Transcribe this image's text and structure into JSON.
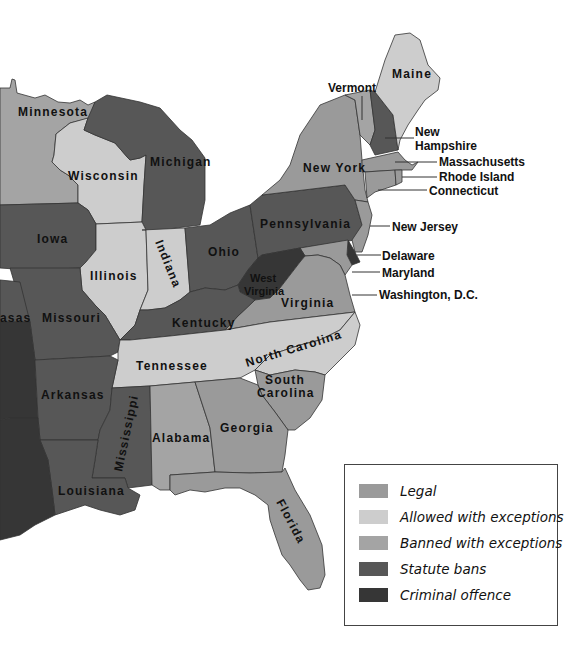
{
  "colors": {
    "legal": "#9a9a9a",
    "allowed": "#cdcdcd",
    "banned_exceptions": "#a4a4a4",
    "statute": "#575757",
    "criminal": "#363636"
  },
  "legend": {
    "items": [
      {
        "label": "Legal",
        "color": "#9a9a9a"
      },
      {
        "label": "Allowed with exceptions",
        "color": "#cdcdcd"
      },
      {
        "label": "Banned with exceptions",
        "color": "#a4a4a4"
      },
      {
        "label": "Statute bans",
        "color": "#575757"
      },
      {
        "label": "Criminal offence",
        "color": "#363636"
      }
    ]
  },
  "states": {
    "minnesota": {
      "name": "Minnesota",
      "category": "Banned with exceptions"
    },
    "wisconsin": {
      "name": "Wisconsin",
      "category": "Allowed with exceptions"
    },
    "michigan": {
      "name": "Michigan",
      "category": "Statute bans"
    },
    "iowa": {
      "name": "Iowa",
      "category": "Statute bans"
    },
    "illinois": {
      "name": "Illinois",
      "category": "Allowed with exceptions"
    },
    "indiana": {
      "name": "Indiana",
      "category": "Allowed with exceptions"
    },
    "ohio": {
      "name": "Ohio",
      "category": "Statute bans"
    },
    "pennsylvania": {
      "name": "Pennsylvania",
      "category": "Statute bans"
    },
    "new_york": {
      "name": "New York",
      "category": "Legal"
    },
    "vermont": {
      "name": "Vermont",
      "category": "Banned with exceptions"
    },
    "maine": {
      "name": "Maine",
      "category": "Allowed with exceptions"
    },
    "new_hampshire": {
      "name": "New Hampshire",
      "category": "Statute bans"
    },
    "massachusetts": {
      "name": "Massachusetts",
      "category": "Legal"
    },
    "rhode_island": {
      "name": "Rhode Island",
      "category": "Legal"
    },
    "connecticut": {
      "name": "Connecticut",
      "category": "Legal"
    },
    "new_jersey": {
      "name": "New Jersey",
      "category": "Legal"
    },
    "delaware": {
      "name": "Delaware",
      "category": "Criminal offence"
    },
    "maryland": {
      "name": "Maryland",
      "category": "Legal"
    },
    "washington_dc": {
      "name": "Washington, D.C.",
      "category": "Legal"
    },
    "west_virginia": {
      "name": "West Virginia",
      "category": "Criminal offence"
    },
    "west_virginia_line1": "West",
    "west_virginia_line2": "Virginia",
    "virginia": {
      "name": "Virginia",
      "category": "Legal"
    },
    "kentucky": {
      "name": "Kentucky",
      "category": "Statute bans"
    },
    "missouri": {
      "name": "Missouri",
      "category": "Statute bans"
    },
    "kansas_partial": {
      "name": "asas",
      "category": "Statute bans"
    },
    "tennessee": {
      "name": "Tennessee",
      "category": "Allowed with exceptions"
    },
    "north_carolina": {
      "name": "North Carolina",
      "category": "Allowed with exceptions"
    },
    "south_carolina": {
      "name": "South Carolina",
      "category": "Legal"
    },
    "south_carolina_line1": "South",
    "south_carolina_line2": "Carolina",
    "arkansas": {
      "name": "Arkansas",
      "category": "Statute bans"
    },
    "mississippi": {
      "name": "Mississippi",
      "category": "Statute bans"
    },
    "alabama": {
      "name": "Alabama",
      "category": "Banned with exceptions"
    },
    "georgia": {
      "name": "Georgia",
      "category": "Legal"
    },
    "florida": {
      "name": "Florida",
      "category": "Legal"
    },
    "louisiana": {
      "name": "Louisiana",
      "category": "Statute bans"
    },
    "oklahoma_partial": {
      "category": "Criminal offence"
    },
    "texas_partial": {
      "category": "Criminal offence"
    }
  },
  "new_hampshire_line1": "New",
  "new_hampshire_line2": "Hampshire"
}
